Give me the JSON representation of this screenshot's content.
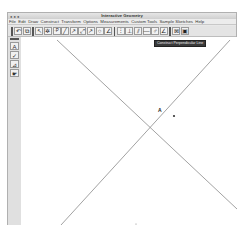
{
  "window": {
    "title": "Interactive Geometry",
    "traffic_lights": "● ● ●"
  },
  "menubar": {
    "items": [
      "File",
      "Edit",
      "Draw",
      "Construct",
      "Transform",
      "Options",
      "Measurements",
      "Custom Tools",
      "Sample Sketches",
      "Help"
    ]
  },
  "toolbar": {
    "groups": [
      {
        "name": "history",
        "buttons": [
          {
            "id": "undo",
            "glyph": "↶"
          },
          {
            "id": "copy",
            "glyph": "⧉"
          }
        ]
      },
      {
        "name": "draw",
        "buttons": [
          {
            "id": "select",
            "glyph": "↖"
          },
          {
            "id": "rotate",
            "glyph": "✲"
          },
          {
            "id": "point",
            "glyph": "·P"
          },
          {
            "id": "segment",
            "glyph": "╱"
          },
          {
            "id": "ray",
            "glyph": "↗"
          },
          {
            "id": "line",
            "glyph": "⤢"
          },
          {
            "id": "vector",
            "glyph": "↗"
          },
          {
            "id": "circle",
            "glyph": "○"
          },
          {
            "id": "angle",
            "glyph": "∠"
          }
        ]
      },
      {
        "name": "construct",
        "buttons": [
          {
            "id": "midpoint",
            "glyph": "⫶"
          },
          {
            "id": "perpendicular",
            "glyph": "⊥"
          },
          {
            "id": "parallel",
            "glyph": "⫽"
          },
          {
            "id": "bisector",
            "glyph": "—"
          },
          {
            "id": "arc",
            "glyph": "♂"
          },
          {
            "id": "angle-bisector",
            "glyph": "∠"
          }
        ]
      },
      {
        "name": "view",
        "buttons": [
          {
            "id": "grid",
            "glyph": "⊠"
          },
          {
            "id": "window",
            "glyph": "▣"
          }
        ]
      }
    ]
  },
  "tooltip": {
    "text": "Construct Perpendicular Line"
  },
  "palette": {
    "buttons": [
      {
        "id": "text-tool",
        "glyph": "A"
      },
      {
        "id": "check-tool",
        "glyph": "✓"
      },
      {
        "id": "measure-tool",
        "glyph": "⊿"
      },
      {
        "id": "hand-tool",
        "glyph": "☛"
      }
    ]
  },
  "canvas": {
    "lines": [
      {
        "x1": 36,
        "y1": 3,
        "x2": 216,
        "y2": 172
      },
      {
        "x1": 209,
        "y1": 3,
        "x2": 40,
        "y2": 188
      }
    ],
    "points": [
      {
        "label": "A",
        "x": 153,
        "y": 79
      }
    ],
    "colors": {
      "line": "#8a8a8a",
      "point": "#333333"
    }
  }
}
